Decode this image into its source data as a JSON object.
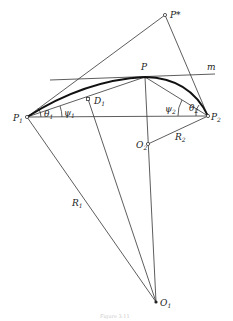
{
  "diagram": {
    "labels": {
      "p_star": "P*",
      "p": "P",
      "m": "m",
      "p1": "P",
      "p1_sub": "1",
      "p2": "P",
      "p2_sub": "2",
      "d1": "D",
      "d1_sub": "1",
      "o1": "O",
      "o1_sub": "1",
      "o2": "O",
      "o2_sub": "2",
      "r1": "R",
      "r1_sub": "1",
      "r2": "R",
      "r2_sub": "2",
      "theta1": "θ",
      "theta1_sub": "1",
      "psi1": "ψ",
      "psi1_sub": "1",
      "theta2": "θ",
      "theta2_sub": "2",
      "psi2": "ψ",
      "psi2_sub": "2"
    },
    "caption": "Figure 3.11",
    "points": {
      "P_star": [
        165,
        15
      ],
      "P": [
        145,
        77
      ],
      "P1": [
        27,
        117
      ],
      "P2": [
        208,
        116
      ],
      "D1": [
        88,
        99
      ],
      "O1": [
        156,
        302
      ],
      "O2": [
        148,
        144
      ]
    }
  }
}
